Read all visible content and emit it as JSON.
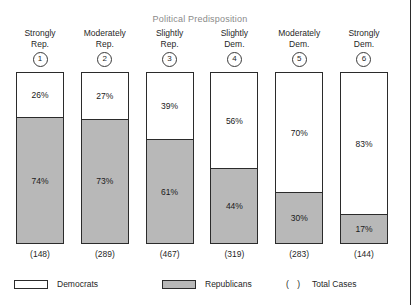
{
  "chart_data": {
    "type": "bar",
    "title": "Political Predisposition",
    "xlabel": "",
    "ylabel": "",
    "ylim": [
      0,
      100
    ],
    "grid": false,
    "stacked": true,
    "legend_position": "bottom",
    "categories": [
      "Strongly Rep.",
      "Moderately Rep.",
      "Slightly Rep.",
      "Slightly Dem.",
      "Moderately Dem.",
      "Strongly Dem."
    ],
    "series": [
      {
        "name": "Democrats",
        "values": [
          26,
          27,
          39,
          56,
          70,
          83
        ]
      },
      {
        "name": "Republicans",
        "values": [
          74,
          73,
          61,
          44,
          30,
          17
        ]
      }
    ],
    "total_cases": [
      148,
      289,
      467,
      319,
      283,
      144
    ],
    "annotations": [
      "( ) Total Cases"
    ]
  },
  "colors": {
    "democrats": "#ffffff",
    "republicans": "#b8b8b8",
    "outline": "#2b2b2b",
    "title": "#8a8a8a"
  },
  "columns": [
    {
      "badge": "1",
      "header_line1": "Strongly",
      "header_line2": "Rep.",
      "dem_label": "26%",
      "rep_label": "74%",
      "dem_pct": 26,
      "rep_pct": 74,
      "count_label": "(148)"
    },
    {
      "badge": "2",
      "header_line1": "Moderately",
      "header_line2": "Rep.",
      "dem_label": "27%",
      "rep_label": "73%",
      "dem_pct": 27,
      "rep_pct": 73,
      "count_label": "(289)"
    },
    {
      "badge": "3",
      "header_line1": "Slightly",
      "header_line2": "Rep.",
      "dem_label": "39%",
      "rep_label": "61%",
      "dem_pct": 39,
      "rep_pct": 61,
      "count_label": "(467)"
    },
    {
      "badge": "4",
      "header_line1": "Slightly",
      "header_line2": "Dem.",
      "dem_label": "56%",
      "rep_label": "44%",
      "dem_pct": 56,
      "rep_pct": 44,
      "count_label": "(319)"
    },
    {
      "badge": "5",
      "header_line1": "Moderately",
      "header_line2": "Dem.",
      "dem_label": "70%",
      "rep_label": "30%",
      "dem_pct": 70,
      "rep_pct": 30,
      "count_label": "(283)"
    },
    {
      "badge": "6",
      "header_line1": "Strongly",
      "header_line2": "Dem.",
      "dem_label": "83%",
      "rep_label": "17%",
      "dem_pct": 83,
      "rep_pct": 17,
      "count_label": "(144)"
    }
  ],
  "legend": {
    "democrats_label": "Democrats",
    "republicans_label": "Republicans",
    "paren_symbol": "(  )",
    "total_cases_label": "Total Cases"
  }
}
